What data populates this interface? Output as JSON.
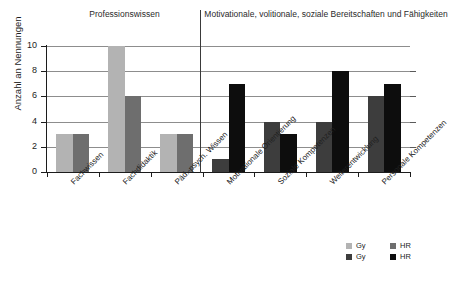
{
  "headers": {
    "left": "Professionswissen",
    "right": "Motivationale, volitionale, soziale Bereitschaften und Fähigkeiten"
  },
  "axis": {
    "y_title": "Anzahl an Nennungen",
    "ticks": [
      "0",
      "2",
      "4",
      "6",
      "8",
      "10"
    ]
  },
  "legend": {
    "row1": [
      {
        "label": "Gy",
        "color": "#b3b3b3"
      },
      {
        "label": "HR",
        "color": "#6e6e6e"
      }
    ],
    "row2": [
      {
        "label": "Gy",
        "color": "#3d3d3d"
      },
      {
        "label": "HR",
        "color": "#0d0d0d"
      }
    ]
  },
  "chart_data": {
    "type": "bar",
    "title": "",
    "xlabel": "",
    "ylabel": "Anzahl an Nennungen",
    "ylim": [
      0,
      10
    ],
    "ytick_step": 2,
    "grid": true,
    "legend_position": "bottom-right",
    "categories": [
      "Fachwissen",
      "Fachdidaktik",
      "Päd.-psych. Wissen",
      "Motivationale Orientierung",
      "Soziale Kompetenzen",
      "Weiterentwicklung",
      "Personale Kompetenzen"
    ],
    "group_sections": [
      {
        "name": "Professionswissen",
        "categories": [
          0,
          1,
          2
        ]
      },
      {
        "name": "Motivationale, volitionale, soziale Bereitschaften und Fähigkeiten",
        "categories": [
          3,
          4,
          5,
          6
        ]
      }
    ],
    "series": [
      {
        "name": "Gy",
        "values": [
          3,
          10,
          3,
          1,
          4,
          4,
          6
        ]
      },
      {
        "name": "HR",
        "values": [
          3,
          6,
          3,
          7,
          3,
          8,
          7
        ]
      }
    ],
    "bar_colors": {
      "section1": {
        "Gy": "#b3b3b3",
        "HR": "#6e6e6e"
      },
      "section2": {
        "Gy": "#3d3d3d",
        "HR": "#0d0d0d"
      }
    }
  }
}
